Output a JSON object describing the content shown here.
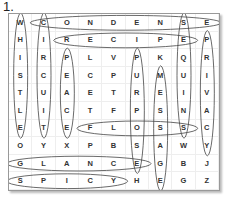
{
  "puzzle": {
    "number_label": "1.",
    "rows": 10,
    "cols": 9,
    "grid": [
      [
        "W",
        "C",
        "O",
        "N",
        "D",
        "E",
        "N",
        "S",
        "E"
      ],
      [
        "H",
        "I",
        "R",
        "E",
        "C",
        "I",
        "P",
        "E",
        "P"
      ],
      [
        "I",
        "R",
        "P",
        "L",
        "V",
        "P",
        "K",
        "Q",
        "R"
      ],
      [
        "S",
        "C",
        "E",
        "C",
        "P",
        "U",
        "M",
        "U",
        "I"
      ],
      [
        "T",
        "U",
        "A",
        "E",
        "T",
        "R",
        "E",
        "I",
        "V"
      ],
      [
        "L",
        "I",
        "C",
        "T",
        "F",
        "P",
        "S",
        "N",
        "A"
      ],
      [
        "E",
        "T",
        "E",
        "F",
        "L",
        "O",
        "S",
        "S",
        "C"
      ],
      [
        "O",
        "Y",
        "X",
        "P",
        "B",
        "S",
        "A",
        "W",
        "Y"
      ],
      [
        "G",
        "L",
        "A",
        "N",
        "C",
        "E",
        "G",
        "B",
        "J"
      ],
      [
        "S",
        "P",
        "I",
        "C",
        "Y",
        "H",
        "E",
        "G",
        "Z"
      ]
    ],
    "found_words": [
      {
        "word": "WHISTLE",
        "dir": "vertical",
        "row": 0,
        "col": 0,
        "len": 7
      },
      {
        "word": "CIRCUIT",
        "dir": "vertical",
        "row": 0,
        "col": 1,
        "len": 7
      },
      {
        "word": "CONDENSE",
        "dir": "horizontal",
        "row": 0,
        "col": 1,
        "len": 8
      },
      {
        "word": "RECIPE",
        "dir": "horizontal",
        "row": 1,
        "col": 2,
        "len": 6
      },
      {
        "word": "PEACE",
        "dir": "vertical",
        "row": 2,
        "col": 2,
        "len": 5
      },
      {
        "word": "PURPOSE",
        "dir": "vertical",
        "row": 2,
        "col": 5,
        "len": 7
      },
      {
        "word": "MESSAGE",
        "dir": "vertical",
        "row": 3,
        "col": 6,
        "len": 7
      },
      {
        "word": "SQUINTS",
        "dir": "vertical",
        "row": 0,
        "col": 7,
        "len": 7
      },
      {
        "word": "PRIVACY",
        "dir": "vertical",
        "row": 1,
        "col": 8,
        "len": 7
      },
      {
        "word": "FLOSS",
        "dir": "horizontal",
        "row": 6,
        "col": 3,
        "len": 5
      },
      {
        "word": "GLANCE",
        "dir": "horizontal",
        "row": 8,
        "col": 0,
        "len": 6
      },
      {
        "word": "SPICY",
        "dir": "horizontal",
        "row": 9,
        "col": 0,
        "len": 5
      }
    ]
  }
}
